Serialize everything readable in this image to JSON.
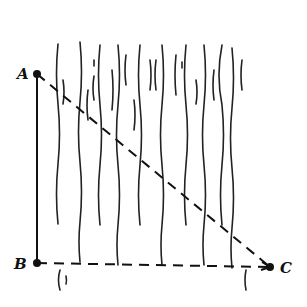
{
  "diagram": {
    "points": {
      "A": {
        "label": "A",
        "x": 37,
        "y": 74
      },
      "B": {
        "label": "B",
        "x": 37,
        "y": 263
      },
      "C": {
        "label": "C",
        "x": 270,
        "y": 267
      }
    },
    "segments": [
      {
        "from": "A",
        "to": "B",
        "style": "solid"
      },
      {
        "from": "A",
        "to": "C",
        "style": "dashed"
      },
      {
        "from": "B",
        "to": "C",
        "style": "dashed"
      }
    ],
    "region": {
      "type": "water-current",
      "x_start": 55,
      "x_end": 250,
      "y_start": 42,
      "y_end": 290
    },
    "colors": {
      "ink": "#111111",
      "background": "#ffffff"
    }
  }
}
